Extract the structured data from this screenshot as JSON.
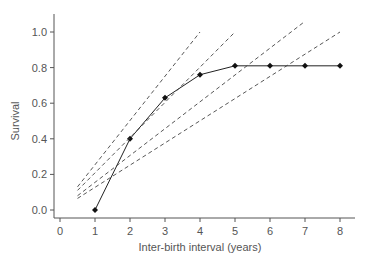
{
  "chart_data": {
    "type": "line",
    "title": "",
    "xlabel": "Inter-birth interval (years)",
    "ylabel": "Survival",
    "xlim": [
      -0.15,
      8.3
    ],
    "ylim": [
      -0.05,
      1.1
    ],
    "xticks": [
      0,
      1,
      2,
      3,
      4,
      5,
      6,
      7,
      8
    ],
    "yticks": [
      0.0,
      0.2,
      0.4,
      0.6,
      0.8,
      1.0
    ],
    "xtick_labels": [
      "0",
      "1",
      "2",
      "3",
      "4",
      "5",
      "6",
      "7",
      "8"
    ],
    "ytick_labels": [
      "0.0",
      "0.2",
      "0.4",
      "0.6",
      "0.8",
      "1.0"
    ],
    "grid": false,
    "legend": null,
    "series": [
      {
        "name": "Survival curve",
        "style": "solid-with-diamond-markers",
        "color": "#222222",
        "x": [
          1,
          2,
          3,
          4,
          5,
          6,
          7,
          8
        ],
        "y": [
          0.0,
          0.4,
          0.63,
          0.76,
          0.81,
          0.81,
          0.81,
          0.81
        ]
      },
      {
        "name": "Dashed line A",
        "style": "dashed",
        "color": "#444444",
        "x": [
          0.5,
          4.0
        ],
        "y": [
          0.13,
          1.0
        ]
      },
      {
        "name": "Dashed line B",
        "style": "dashed",
        "color": "#444444",
        "x": [
          0.5,
          5.0
        ],
        "y": [
          0.11,
          1.0
        ]
      },
      {
        "name": "Dashed line C",
        "style": "dashed",
        "color": "#444444",
        "x": [
          0.5,
          7.0
        ],
        "y": [
          0.08,
          1.06
        ]
      },
      {
        "name": "Dashed line D",
        "style": "dashed",
        "color": "#444444",
        "x": [
          0.5,
          8.0
        ],
        "y": [
          0.065,
          1.0
        ]
      }
    ]
  }
}
